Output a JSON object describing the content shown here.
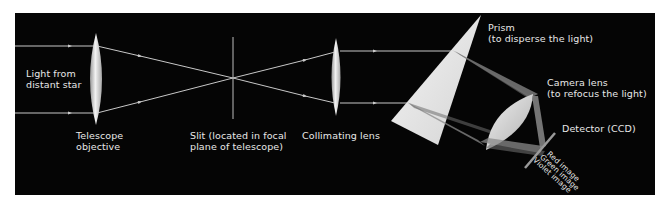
{
  "diagram": {
    "background_color": "#050505",
    "ray_color": "#c8c8c8",
    "lens_color": "#e0e0e0",
    "labels": {
      "light_source": [
        "Light from",
        "distant star"
      ],
      "telescope_objective": [
        "Telescope",
        "objective"
      ],
      "slit": [
        "Slit (located in focal",
        "plane of telescope)"
      ],
      "collimating_lens": "Collimating lens",
      "prism": [
        "Prism",
        "(to disperse the light)"
      ],
      "camera_lens": [
        "Camera lens",
        "(to refocus the light)"
      ],
      "detector": "Detector (CCD)",
      "images": [
        "Red image",
        "Green image",
        "Violet image"
      ]
    }
  }
}
